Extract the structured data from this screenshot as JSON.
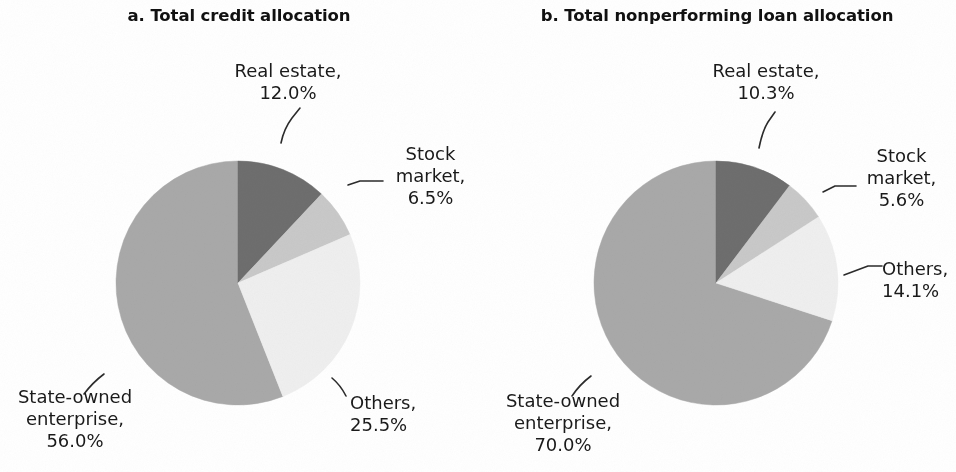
{
  "figure": {
    "background": "#ffffff",
    "text_color": "#1a1a1a"
  },
  "palette": {
    "real_estate": "#6e6e6e",
    "stock_market": "#c9c9c9",
    "others": "#efefef",
    "state_owned_enterprise": "#a9a9a9",
    "leader_line": "#2b2b2b"
  },
  "panels": [
    {
      "id": "panel-a",
      "title": "a. Total credit allocation",
      "labels": {
        "real_estate": {
          "line1": "Real estate,",
          "line2": "12.0%"
        },
        "stock_market": {
          "line1": "Stock",
          "line2": "market,",
          "line3": "6.5%"
        },
        "others": {
          "line1": "Others,",
          "line2": "25.5%"
        },
        "state_owned": {
          "line1": "State-owned",
          "line2": "enterprise,",
          "line3": "56.0%"
        }
      }
    },
    {
      "id": "panel-b",
      "title": "b. Total nonperforming loan allocation",
      "labels": {
        "real_estate": {
          "line1": "Real estate,",
          "line2": "10.3%"
        },
        "stock_market": {
          "line1": "Stock",
          "line2": "market,",
          "line3": "5.6%"
        },
        "others": {
          "line1": "Others,",
          "line2": "14.1%"
        },
        "state_owned": {
          "line1": "State-owned",
          "line2": "enterprise,",
          "line3": "70.0%"
        }
      }
    }
  ],
  "chart_data": [
    {
      "type": "pie",
      "title": "a. Total credit allocation",
      "panel": "a",
      "unit": "percent",
      "start_angle_deg": 0,
      "direction": "clockwise",
      "labels": [
        "Real estate",
        "Stock market",
        "Others",
        "State-owned enterprise"
      ],
      "values": [
        12.0,
        6.5,
        25.5,
        56.0
      ],
      "value_labels": [
        "12.0%",
        "6.5%",
        "25.5%",
        "56.0%"
      ],
      "colors": [
        "#6e6e6e",
        "#c9c9c9",
        "#efefef",
        "#a9a9a9"
      ],
      "legend": "none",
      "data_labels": "outside-with-leader-lines",
      "grid": false
    },
    {
      "type": "pie",
      "title": "b. Total nonperforming loan allocation",
      "panel": "b",
      "unit": "percent",
      "start_angle_deg": 0,
      "direction": "clockwise",
      "labels": [
        "Real estate",
        "Stock market",
        "Others",
        "State-owned enterprise"
      ],
      "values": [
        10.3,
        5.6,
        14.1,
        70.0
      ],
      "value_labels": [
        "10.3%",
        "5.6%",
        "14.1%",
        "70.0%"
      ],
      "colors": [
        "#6e6e6e",
        "#c9c9c9",
        "#efefef",
        "#a9a9a9"
      ],
      "legend": "none",
      "data_labels": "outside-with-leader-lines",
      "grid": false
    }
  ]
}
